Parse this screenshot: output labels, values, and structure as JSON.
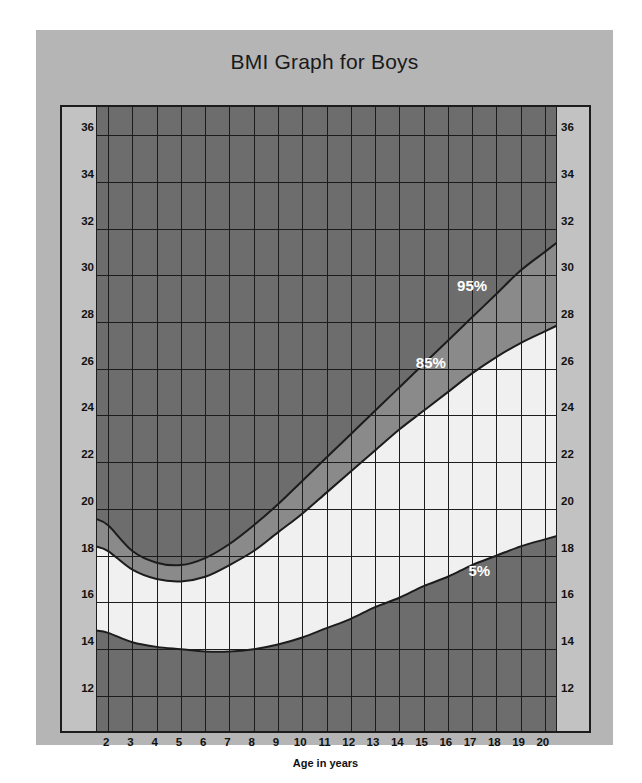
{
  "chart_data": {
    "type": "area",
    "title": "BMI Graph for Boys",
    "xlabel": "Age in years",
    "ylabel": "",
    "xlim": [
      1.5,
      20.5
    ],
    "ylim": [
      10.5,
      37.2
    ],
    "grid": true,
    "legend_position": "inline-annotations",
    "x_ticks": [
      2,
      3,
      4,
      5,
      6,
      7,
      8,
      9,
      10,
      11,
      12,
      13,
      14,
      15,
      16,
      17,
      18,
      19,
      20
    ],
    "y_ticks": [
      12,
      14,
      16,
      18,
      20,
      22,
      24,
      26,
      28,
      30,
      32,
      34,
      36
    ],
    "annotations": [
      {
        "text": "95%",
        "x": 17.0,
        "y": 29.6
      },
      {
        "text": "85%",
        "x": 15.3,
        "y": 26.3
      },
      {
        "text": "5%",
        "x": 17.3,
        "y": 17.4
      }
    ],
    "x": [
      2,
      3,
      4,
      5,
      6,
      7,
      8,
      9,
      10,
      11,
      12,
      13,
      14,
      15,
      16,
      17,
      18,
      19,
      20
    ],
    "series": [
      {
        "name": "95%",
        "values": [
          19.3,
          18.2,
          17.7,
          17.6,
          17.9,
          18.5,
          19.3,
          20.2,
          21.2,
          22.2,
          23.2,
          24.2,
          25.2,
          26.2,
          27.2,
          28.2,
          29.2,
          30.2,
          31.0
        ]
      },
      {
        "name": "85%",
        "values": [
          18.2,
          17.4,
          17.0,
          16.9,
          17.1,
          17.6,
          18.2,
          19.0,
          19.8,
          20.7,
          21.6,
          22.5,
          23.4,
          24.2,
          25.0,
          25.8,
          26.5,
          27.1,
          27.6
        ]
      },
      {
        "name": "5%",
        "values": [
          14.7,
          14.3,
          14.1,
          14.0,
          13.9,
          13.9,
          14.0,
          14.2,
          14.5,
          14.9,
          15.3,
          15.8,
          16.2,
          16.7,
          17.1,
          17.6,
          18.0,
          18.4,
          18.7
        ]
      }
    ],
    "bands": [
      {
        "name": "above-95th",
        "color": "#6d6d6d",
        "description": "obese zone above 95th percentile"
      },
      {
        "name": "85th-to-95th",
        "color": "#8a8a8a",
        "description": "overweight zone between 85th and 95th percentile"
      },
      {
        "name": "5th-to-85th",
        "color": "#f0f0f0",
        "description": "healthy weight zone between 5th and 85th percentile"
      },
      {
        "name": "below-5th",
        "color": "#6d6d6d",
        "description": "underweight zone below 5th percentile"
      }
    ],
    "colors": {
      "panel_background": "#b5b5b5",
      "gutter_background": "#c2c2c2",
      "grid_background": "#9a9a9a",
      "grid_line": "#1c1c1c",
      "healthy_band": "#f0f0f0",
      "overweight_band": "#8a8a8a",
      "outer_band": "#6d6d6d",
      "label_text": "#111111",
      "annotation_text": "#ffffff",
      "title_text": "#1a1a1a"
    }
  }
}
